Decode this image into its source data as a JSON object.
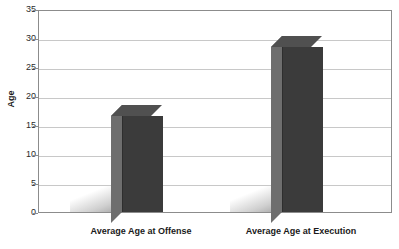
{
  "chart_data": {
    "type": "bar",
    "title": "",
    "xlabel": "",
    "ylabel": "Age",
    "categories": [
      "Average Age at Offense",
      "Average Age at Execution"
    ],
    "values": [
      16.5,
      28.5
    ],
    "ylim": [
      0,
      35
    ],
    "yticks": [
      0,
      5,
      10,
      15,
      20,
      25,
      30,
      35
    ],
    "ytick_labels": [
      "0",
      "5",
      "10",
      "15",
      "20",
      "25",
      "30",
      "35"
    ],
    "grid": true,
    "legend": false,
    "legend_position": "none",
    "series": [
      {
        "name": "Age",
        "values": [
          16.5,
          28.5
        ],
        "color": "#3b3b3b"
      }
    ],
    "style": {
      "bar_front_color": "#3b3b3b",
      "bar_side_color": "#6e6e6e",
      "bar_top_color": "#505050",
      "gridline_color": "#c8c8c8",
      "axis_color": "#8c8c8c",
      "background": "#ffffff",
      "text_color": "#1a1a1a"
    }
  }
}
